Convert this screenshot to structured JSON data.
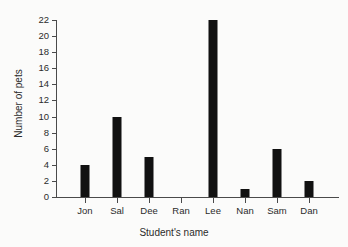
{
  "chart_data": {
    "type": "bar",
    "title": "",
    "categories": [
      "Jon",
      "Sal",
      "Dee",
      "Ran",
      "Lee",
      "Nan",
      "Sam",
      "Dan"
    ],
    "values": [
      4,
      10,
      5,
      0,
      22,
      1,
      6,
      2
    ],
    "xlabel": "Student's name",
    "ylabel": "Number of pets",
    "ylim": [
      0,
      22
    ],
    "ytick_step": 2,
    "yticks": [
      0,
      2,
      4,
      6,
      8,
      10,
      12,
      14,
      16,
      18,
      20,
      22
    ],
    "ytick_labels": [
      "0",
      "2",
      "4",
      "6",
      "8",
      "10",
      "12",
      "14",
      "16",
      "18",
      "20",
      "22"
    ],
    "grid": false,
    "legend": false,
    "bar_color": "#111111",
    "axis_color": "#4a4a4a",
    "background_color": "#fbfbfa"
  }
}
